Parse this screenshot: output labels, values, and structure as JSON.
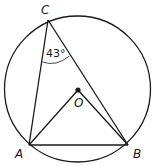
{
  "diagram": {
    "type": "inscribed-angle-circle",
    "circle": {
      "center_label": "O"
    },
    "points": {
      "A": {
        "label": "A"
      },
      "B": {
        "label": "B"
      },
      "C": {
        "label": "C"
      },
      "O": {
        "label": "O"
      }
    },
    "segments": [
      "CA",
      "CB",
      "AB",
      "OA",
      "OB"
    ],
    "angle": {
      "vertex": "C",
      "value": "43°"
    }
  }
}
